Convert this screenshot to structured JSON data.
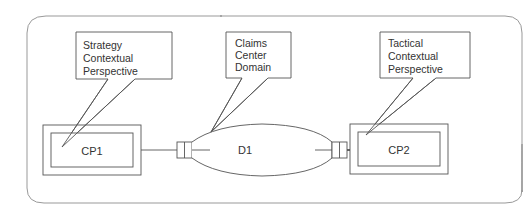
{
  "diagram": {
    "stroke_color": "#555555",
    "frame_color": "#888888",
    "callouts": [
      {
        "id": "strategy",
        "lines": [
          "Strategy",
          "Contextual",
          "Perspective"
        ]
      },
      {
        "id": "claims",
        "lines": [
          "Claims",
          "Center",
          "Domain"
        ]
      },
      {
        "id": "tactical",
        "lines": [
          "Tactical",
          "Contextual",
          "Perspective"
        ]
      }
    ],
    "nodes": {
      "cp1": {
        "label": "CP1"
      },
      "d1": {
        "label": "D1"
      },
      "cp2": {
        "label": "CP2"
      }
    }
  }
}
